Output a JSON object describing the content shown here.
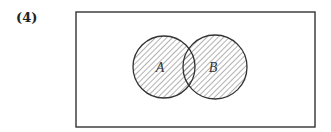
{
  "problem_number": "(4)",
  "diagram": {
    "type": "venn",
    "universe": {
      "x": 76,
      "y": 12,
      "width": 239,
      "height": 115
    },
    "sets": [
      {
        "label": "A",
        "cx": 164,
        "cy": 67,
        "r": 31,
        "shaded": true
      },
      {
        "label": "B",
        "cx": 215,
        "cy": 67,
        "r": 32,
        "shaded": true
      }
    ],
    "shaded_region": "A ∪ B",
    "colors": {
      "stroke": "#333333",
      "hatch": "#555555",
      "background": "#ffffff"
    }
  }
}
